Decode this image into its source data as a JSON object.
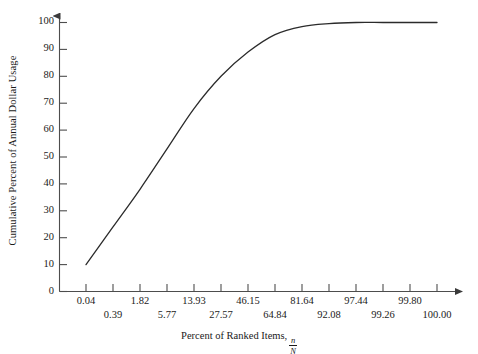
{
  "chart_data": {
    "type": "line",
    "title": "",
    "xlabel": "Percent of Ranked Items, n/N",
    "xlabel_text": "Percent of Ranked Items,",
    "xlabel_fraction_numerator": "n",
    "xlabel_fraction_denominator": "N",
    "ylabel": "Cumulative Percent of Annual Dollar Usage",
    "grid": false,
    "legend": "none",
    "line_color": "#2b2b2b",
    "axis_color": "#4d4d4d",
    "background_color": "#ffffff",
    "xtick_labels": [
      "0.04",
      "0.39",
      "1.82",
      "5.77",
      "13.93",
      "27.57",
      "46.15",
      "64.84",
      "81.64",
      "92.08",
      "97.44",
      "99.26",
      "99.80",
      "100.00"
    ],
    "ytick_labels": [
      "0",
      "10",
      "20",
      "30",
      "40",
      "50",
      "60",
      "70",
      "80",
      "90",
      "100"
    ],
    "ylim": [
      0,
      100
    ],
    "ytick_values": [
      0,
      10,
      20,
      30,
      40,
      50,
      60,
      70,
      80,
      90,
      100
    ],
    "x": [
      0.04,
      0.39,
      1.82,
      5.77,
      13.93,
      27.57,
      46.15,
      64.84,
      81.64,
      92.08,
      97.44,
      99.26,
      99.8,
      100.0
    ],
    "values": [
      10,
      24,
      38,
      53,
      68,
      80,
      89,
      95.5,
      98.5,
      99.6,
      100,
      100,
      100,
      100
    ],
    "series": [
      {
        "name": "Cumulative Percent of Annual Dollar Usage",
        "values": [
          10,
          24,
          38,
          53,
          68,
          80,
          89,
          95.5,
          98.5,
          99.6,
          100,
          100,
          100,
          100
        ]
      }
    ]
  }
}
